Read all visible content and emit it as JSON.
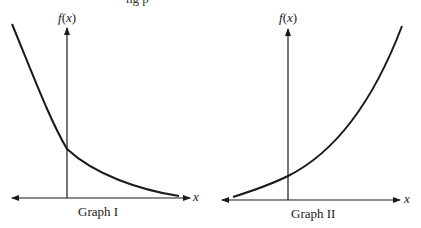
{
  "header_fragment": "ng p",
  "graphs": [
    {
      "id": "graph-1",
      "caption": "Graph I",
      "y_axis_label": "f(x)",
      "x_axis_label": "x",
      "curve": "decreasing, concave up (exponential decay)"
    },
    {
      "id": "graph-2",
      "caption": "Graph II",
      "y_axis_label": "f(x)",
      "x_axis_label": "x",
      "curve": "increasing, concave up (exponential growth)"
    }
  ],
  "colors": {
    "line": "#1a1a1a",
    "background": "#ffffff"
  }
}
